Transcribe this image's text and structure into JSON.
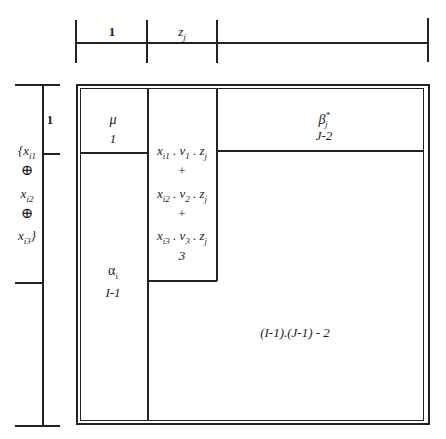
{
  "top_ruler": {
    "labels": [
      "1",
      "z_j",
      ""
    ]
  },
  "left_ruler": {
    "labels": [
      "1",
      "{x_i1 ⊕ x_i2 ⊕ x_i3}",
      ""
    ]
  },
  "cells": {
    "mu": {
      "symbol": "μ",
      "df": "1"
    },
    "alpha": {
      "symbol": "α_i",
      "df": "I-1"
    },
    "beta": {
      "symbol": "β*_j",
      "df": "J-2"
    },
    "interaction": {
      "lines": [
        "x_i1 . ν_1 . z_j",
        "+",
        "x_i2 . ν_2 . z_j",
        "+",
        "x_i3 . ν_3 . z_j"
      ],
      "df": "3"
    },
    "residual": {
      "df": "(I-1).(J-1) - 2"
    }
  },
  "texts": {
    "top_1": "1",
    "z": "z",
    "j": "j",
    "left_1": "1",
    "brace_open": "{x",
    "i1": "i1",
    "oplus": "⊕",
    "x": "x",
    "i2": "i2",
    "i3": "i3",
    "brace_close": "}",
    "mu": "μ",
    "mu_df": "1",
    "alpha": "α",
    "i": "i",
    "alpha_df": "I-1",
    "beta": "β",
    "star": "*",
    "beta_df": "J-2",
    "l1a": "x",
    "l1b": "i1",
    "l1c": " . ν",
    "l1d": "1",
    "l1e": " . z",
    "plus": "+",
    "l2b": "i2",
    "l2d": "2",
    "l3b": "i3",
    "l3d": "3",
    "int_df": "3",
    "res_df": "(I-1).(J-1) - 2"
  }
}
